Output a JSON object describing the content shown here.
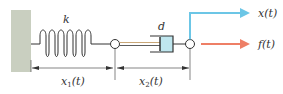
{
  "diagram": {
    "labels": {
      "spring": "k",
      "damper": "d",
      "displacement_output": "x(t)",
      "force_input": "f(t)",
      "dim1_base": "x",
      "dim1_sub": "1",
      "dim1_arg": "(t)",
      "dim2_base": "x",
      "dim2_sub": "2",
      "dim2_arg": "(t)"
    },
    "colors": {
      "wall": "#c9cfc0",
      "line": "#333333",
      "rod": "#c9a777",
      "damper_fill": "#bfe6ee",
      "x_arrow": "#6cc6e6",
      "f_arrow": "#ee7f66"
    }
  }
}
